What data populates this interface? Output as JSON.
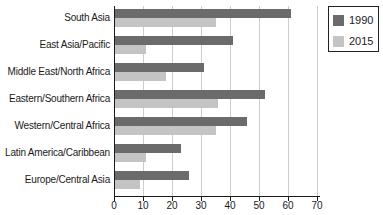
{
  "chart_data": {
    "type": "bar",
    "orientation": "horizontal",
    "title": "",
    "xlabel": "",
    "ylabel": "",
    "categories": [
      "South Asia",
      "East Asia/Pacific",
      "Middle East/North Africa",
      "Eastern/Southern Africa",
      "Western/Central Africa",
      "Latin America/Caribbean",
      "Europe/Central Asia"
    ],
    "series": [
      {
        "name": "1990",
        "color": "#6b6b6b",
        "values": [
          61,
          41,
          31,
          52,
          46,
          23,
          26
        ]
      },
      {
        "name": "2015",
        "color": "#c4c4c4",
        "values": [
          35,
          11,
          18,
          36,
          35,
          11,
          9
        ]
      }
    ],
    "xlim": [
      0,
      70
    ],
    "xticks": [
      0,
      10,
      20,
      30,
      40,
      50,
      60,
      70
    ],
    "grid": true,
    "gridline_color": "#cccccc",
    "axis_color": "#1a1a1a",
    "legend_position": "top-right"
  }
}
